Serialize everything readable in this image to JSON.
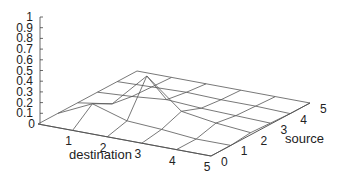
{
  "chart_data": {
    "type": "surface",
    "title": "",
    "xlabel": "destination",
    "ylabel": "source",
    "zlabel": "",
    "x_ticks": [
      "0",
      "1",
      "2",
      "3",
      "4",
      "5"
    ],
    "y_ticks": [
      "0",
      "1",
      "2",
      "3",
      "4",
      "5"
    ],
    "z_ticks": [
      "0",
      "0.1",
      "0.2",
      "0.3",
      "0.4",
      "0.5",
      "0.6",
      "0.7",
      "0.8",
      "0.9",
      "1"
    ],
    "zlim": [
      0,
      1
    ],
    "grid": false,
    "x": [
      0,
      1,
      2,
      3,
      4,
      5
    ],
    "y": [
      0,
      1,
      2,
      3,
      4,
      5
    ],
    "z": [
      [
        0.0,
        0.0,
        0.0,
        0.0,
        0.0,
        0.0
      ],
      [
        0.0,
        0.15,
        0.05,
        0.02,
        0.01,
        0.0
      ],
      [
        0.0,
        0.05,
        0.37,
        0.05,
        0.02,
        0.0
      ],
      [
        0.0,
        0.03,
        0.1,
        0.03,
        0.01,
        0.0
      ],
      [
        0.0,
        0.0,
        0.05,
        0.02,
        0.01,
        0.0
      ],
      [
        0.0,
        0.0,
        0.02,
        0.01,
        0.0,
        0.0
      ]
    ],
    "z_index_note": "z[destination][source]"
  },
  "axis_labels": {
    "destination": "destination",
    "source": "source"
  }
}
